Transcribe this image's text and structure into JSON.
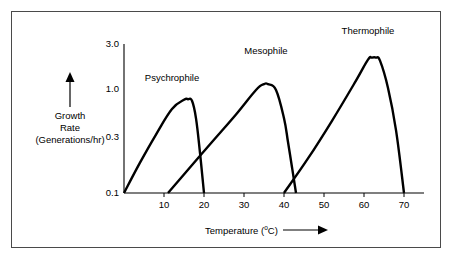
{
  "figure": {
    "background_color": "#ffffff",
    "frame_color": "#4a4a4a",
    "curve_color": "#000000"
  },
  "chart_data": {
    "type": "line",
    "title": "",
    "xlabel": "Temperature (°C)",
    "xlabel_text": "Temperature (",
    "xlabel_degree": "o",
    "xlabel_unit": "C)",
    "ylabel_line1": "Growth",
    "ylabel_line2": "Rate",
    "ylabel_line3": "(Generations/hr)",
    "ylabel": "Growth Rate (Generations/hr)",
    "yscale": "log",
    "ylim": [
      0.1,
      3.0
    ],
    "xlim": [
      0,
      72
    ],
    "grid": false,
    "legend_position": "inline-annotations",
    "xticks": [
      10,
      20,
      30,
      40,
      50,
      60,
      70
    ],
    "xtick_labels": [
      "10",
      "20",
      "30",
      "40",
      "50",
      "60",
      "70"
    ],
    "yticks": [
      0.1,
      0.3,
      1.0,
      3.0
    ],
    "ytick_labels": [
      "0.1",
      "0.3",
      "1.0",
      "3.0"
    ],
    "series": [
      {
        "name": "Psychrophile",
        "label": "Psychrophile",
        "x": [
          0,
          4,
          8,
          12,
          15,
          16,
          17,
          18,
          19,
          20
        ],
        "y": [
          0.1,
          0.2,
          0.38,
          0.68,
          0.84,
          0.85,
          0.82,
          0.55,
          0.25,
          0.1
        ],
        "peak_temp": 16,
        "peak_rate": 0.85,
        "min_temp": 0,
        "max_temp": 20
      },
      {
        "name": "Mesophile",
        "label": "Mesophile",
        "x": [
          11,
          16,
          22,
          28,
          33,
          35,
          36,
          38,
          40,
          41,
          42,
          43
        ],
        "y": [
          0.1,
          0.17,
          0.32,
          0.6,
          1.05,
          1.2,
          1.2,
          1.05,
          0.55,
          0.32,
          0.18,
          0.1
        ],
        "peak_temp": 36,
        "peak_rate": 1.2,
        "min_temp": 11,
        "max_temp": 43
      },
      {
        "name": "Thermophile",
        "label": "Thermophile",
        "x": [
          40,
          46,
          52,
          58,
          61,
          62,
          63,
          64,
          66,
          68,
          70
        ],
        "y": [
          0.1,
          0.22,
          0.52,
          1.3,
          2.1,
          2.2,
          2.2,
          2.05,
          1.1,
          0.42,
          0.1
        ],
        "peak_temp": 62,
        "peak_rate": 2.2,
        "min_temp": 40,
        "max_temp": 70
      }
    ],
    "annotations": [
      {
        "text": "Psychrophile",
        "x": 16,
        "y": 1.25
      },
      {
        "text": "Mesophile",
        "x": 35,
        "y": 1.95
      },
      {
        "text": "Thermophile",
        "x": 62,
        "y": 2.85
      }
    ]
  }
}
